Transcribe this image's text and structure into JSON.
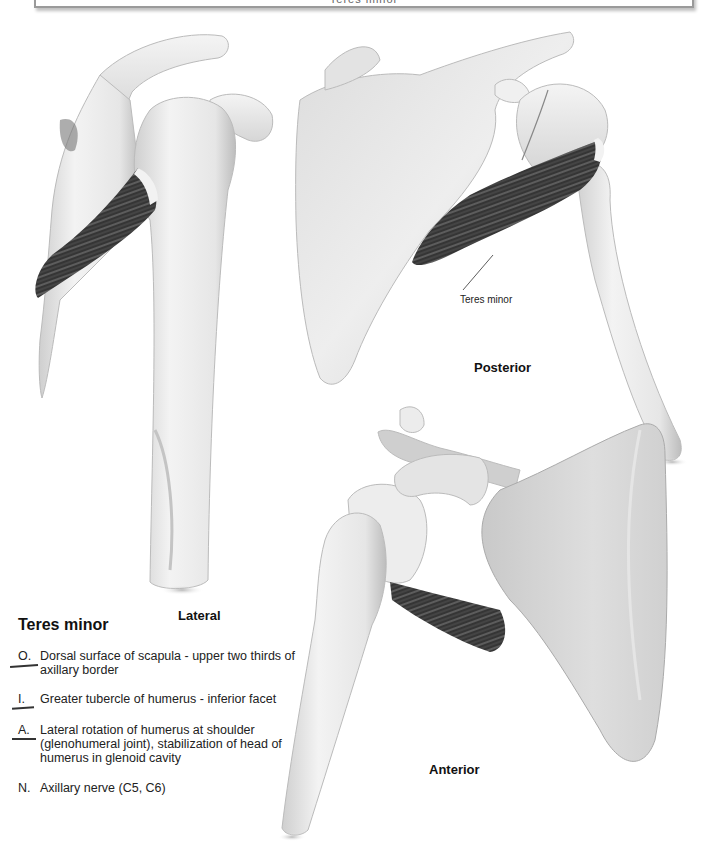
{
  "header": {
    "text": "Teres minor"
  },
  "views": {
    "lateral": {
      "label": "Lateral"
    },
    "posterior": {
      "label": "Posterior",
      "callout": "Teres minor"
    },
    "anterior": {
      "label": "Anterior"
    }
  },
  "muscle": {
    "name": "Teres minor",
    "entries": [
      {
        "letter": "O.",
        "text": "Dorsal surface of scapula - upper two thirds of axillary border",
        "underlined": true
      },
      {
        "letter": "I.",
        "text": "Greater tubercle of humerus - inferior facet",
        "underlined": true
      },
      {
        "letter": "A.",
        "text": "Lateral rotation of humerus at shoulder (glenohumeral joint), stabilization of head of humerus in glenoid cavity",
        "underlined": true
      },
      {
        "letter": "N.",
        "text": "Axillary nerve (C5, C6)",
        "underlined": false
      }
    ]
  },
  "colors": {
    "bone": "#e9e9e9",
    "bone_shadow": "#b5b5b5",
    "muscle": "#3a3a3a",
    "text": "#222222"
  }
}
